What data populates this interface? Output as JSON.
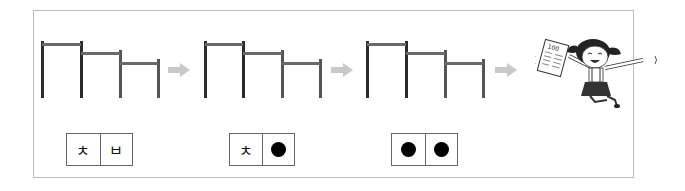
{
  "figure": {
    "title": "",
    "sequence": [
      {
        "step": 1,
        "bar_heights": [
          "high",
          "mid",
          "low"
        ],
        "answer": [
          "ㅊ",
          "ㅂ"
        ]
      },
      {
        "step": 2,
        "bar_heights": [
          "high",
          "mid",
          "low"
        ],
        "answer": [
          "ㅊ",
          "●"
        ]
      },
      {
        "step": 3,
        "bar_heights": [
          "high",
          "mid",
          "low"
        ],
        "answer": [
          "●",
          "●"
        ]
      }
    ],
    "colors": {
      "border": "#bdbdbd",
      "post": "#2b2b2b",
      "rail": "#6a6a6a",
      "arrow": "#c8c8c8"
    },
    "illustration": "girl-jumping-holding-test-paper",
    "paper_score": "100"
  }
}
